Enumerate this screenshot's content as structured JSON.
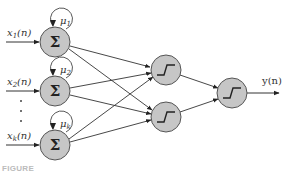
{
  "diagram": {
    "type": "recurrent neural network",
    "inputs": [
      {
        "label": "x",
        "sub": "1",
        "suffix": "(n)"
      },
      {
        "label": "x",
        "sub": "2",
        "suffix": "(n)"
      },
      {
        "label": "x",
        "sub": "k",
        "suffix": "(n)"
      }
    ],
    "ellipsis": "⋮",
    "summing_nodes": [
      {
        "symbol": "Σ",
        "feedback_label": "μ",
        "feedback_sub": "1"
      },
      {
        "symbol": "Σ",
        "feedback_label": "μ",
        "feedback_sub": "2"
      },
      {
        "symbol": "Σ",
        "feedback_label": "μ",
        "feedback_sub": "k"
      }
    ],
    "hidden_nodes": [
      {
        "activation": "step"
      },
      {
        "activation": "step"
      }
    ],
    "output_node": {
      "activation": "step"
    },
    "output_label": "y(n)",
    "colors": {
      "node_fill": "#c6c6c6",
      "node_stroke": "#555555",
      "edge": "#333333"
    }
  },
  "caption": {
    "prefix": "FIGURE",
    "text": "(caption truncated)"
  }
}
